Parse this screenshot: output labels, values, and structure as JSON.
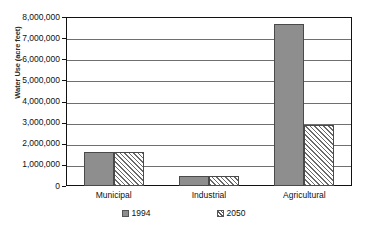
{
  "chart_data": {
    "type": "bar",
    "title": "",
    "xlabel": "",
    "ylabel": "Water Use (acre feet)",
    "categories": [
      "Municipal",
      "Industrial",
      "Agricultural"
    ],
    "series": [
      {
        "name": "1994",
        "values": [
          1600000,
          480000,
          7650000
        ],
        "color": "#8e8e8e",
        "fill": "solid-gray"
      },
      {
        "name": "2050",
        "values": [
          1600000,
          480000,
          2900000
        ],
        "color": "#ffffff",
        "fill": "diagonal-hatch"
      }
    ],
    "ylim": [
      0,
      8000000
    ],
    "ytick_step": 1000000,
    "yticks": [
      0,
      1000000,
      2000000,
      3000000,
      4000000,
      5000000,
      6000000,
      7000000,
      8000000
    ],
    "ytick_labels": [
      "0",
      "1,000,000",
      "2,000,000",
      "3,000,000",
      "4,000,000",
      "5,000,000",
      "6,000,000",
      "7,000,000",
      "8,000,000"
    ],
    "grid": "horizontal",
    "legend_position": "bottom"
  },
  "axis": {
    "y_title": "Water Use (acre feet)"
  },
  "legend": {
    "items": [
      {
        "label": "1994",
        "swatch": "solid-gray-swatch"
      },
      {
        "label": "2050",
        "swatch": "hatched-swatch"
      }
    ]
  }
}
